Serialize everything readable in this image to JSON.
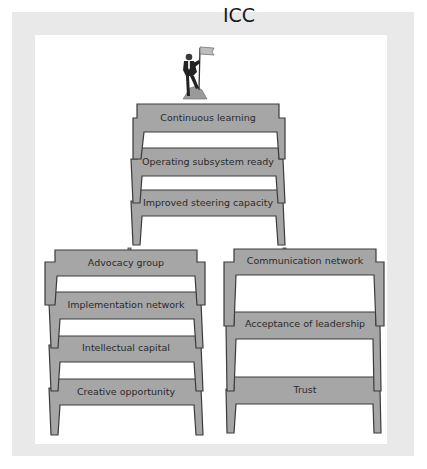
{
  "diagram": {
    "title": "ICC",
    "top_icon": "person-planting-flag-on-summit-icon",
    "top_stack": {
      "levels": [
        {
          "label": "Continuous learning"
        },
        {
          "label": "Operating subsystem ready"
        },
        {
          "label": "Improved steering capacity"
        }
      ]
    },
    "left_stack": {
      "levels": [
        {
          "label": "Advocacy group"
        },
        {
          "label": "Implementation network"
        },
        {
          "label": "Intellectual capital"
        },
        {
          "label": "Creative opportunity"
        }
      ]
    },
    "right_stack": {
      "levels": [
        {
          "label": "Communication network"
        },
        {
          "label": "Acceptance of leadership"
        },
        {
          "label": "Trust"
        }
      ]
    },
    "colors": {
      "plank": "#a6a6a6",
      "outline": "#3a3a3a",
      "frame": "#e9e9e9",
      "background": "#ffffff"
    }
  }
}
